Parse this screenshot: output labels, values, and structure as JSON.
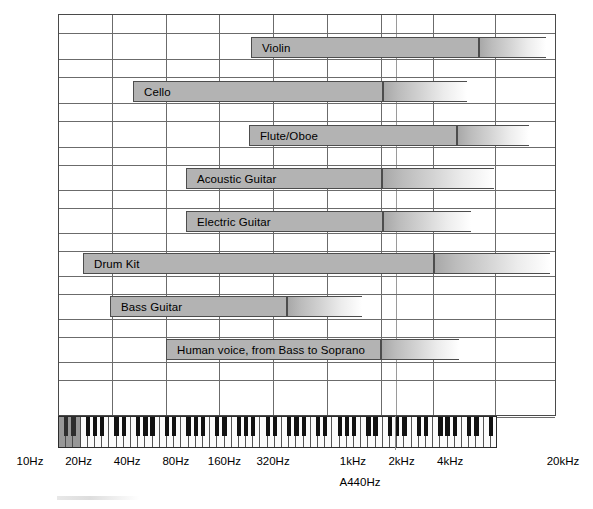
{
  "chart_data": {
    "type": "bar",
    "xlabel": "Frequency",
    "ylabel": "",
    "scale": "log",
    "grid": true,
    "legend": "none",
    "axis_note": "A440Hz",
    "xlim": [
      10,
      20000
    ],
    "tick_labels": [
      "10Hz",
      "20Hz",
      "40Hz",
      "80Hz",
      "160Hz",
      "320Hz",
      "1kHz",
      "2kHz",
      "4kHz",
      "20kHz"
    ],
    "tick_values": [
      10,
      20,
      40,
      80,
      160,
      320,
      1000,
      2000,
      4000,
      20000
    ],
    "categories": [
      "Violin",
      "Cello",
      "Flute/Oboe",
      "Acoustic Guitar",
      "Electric Guitar",
      "Drum Kit",
      "Bass Guitar",
      "Human voice, from Bass to Soprano"
    ],
    "series": [
      {
        "name": "fundamental range",
        "note": "solid bar = fundamental frequency range",
        "values": [
          {
            "label": "Violin",
            "low_hz": 196,
            "high_hz": 3520
          },
          {
            "label": "Cello",
            "low_hz": 65,
            "high_hz": 880
          },
          {
            "label": "Flute/Oboe",
            "low_hz": 196,
            "high_hz": 2349
          },
          {
            "label": "Acoustic Guitar",
            "low_hz": 82,
            "high_hz": 880
          },
          {
            "label": "Electric Guitar",
            "low_hz": 82,
            "high_hz": 1046
          },
          {
            "label": "Drum Kit",
            "low_hz": 25,
            "high_hz": 1760
          },
          {
            "label": "Bass Guitar",
            "low_hz": 41,
            "high_hz": 392
          },
          {
            "label": "Human voice, from Bass to Soprano",
            "low_hz": 82,
            "high_hz": 1046
          }
        ]
      },
      {
        "name": "harmonics fade",
        "note": "gradient extension = harmonic overtones trailing off",
        "values": [
          {
            "label": "Violin",
            "fade_to_hz": 15000
          },
          {
            "label": "Cello",
            "fade_to_hz": 6000
          },
          {
            "label": "Flute/Oboe",
            "fade_to_hz": 14000
          },
          {
            "label": "Acoustic Guitar",
            "fade_to_hz": 12000
          },
          {
            "label": "Electric Guitar",
            "fade_to_hz": 7000
          },
          {
            "label": "Drum Kit",
            "fade_to_hz": 16000
          },
          {
            "label": "Bass Guitar",
            "fade_to_hz": 3000
          },
          {
            "label": "Human voice, from Bass to Soprano",
            "fade_to_hz": 6000
          }
        ]
      }
    ],
    "bars": [
      {
        "label": "Violin",
        "x": 250,
        "solid_w": 228,
        "fade_w": 67,
        "y": 36
      },
      {
        "label": "Cello",
        "x": 132,
        "solid_w": 250,
        "fade_w": 84,
        "y": 80
      },
      {
        "label": "Flute/Oboe",
        "x": 248,
        "solid_w": 208,
        "fade_w": 72,
        "y": 124
      },
      {
        "label": "Acoustic Guitar",
        "x": 185,
        "solid_w": 196,
        "fade_w": 112,
        "y": 167
      },
      {
        "label": "Electric Guitar",
        "x": 185,
        "solid_w": 197,
        "fade_w": 88,
        "y": 210
      },
      {
        "label": "Drum Kit",
        "x": 82,
        "solid_w": 351,
        "fade_w": 116,
        "y": 252
      },
      {
        "label": "Bass Guitar",
        "x": 109,
        "solid_w": 177,
        "fade_w": 75,
        "y": 295
      },
      {
        "label": "Human voice, from Bass to Soprano",
        "x": 165,
        "solid_w": 215,
        "fade_w": 78,
        "y": 338
      }
    ],
    "gridlines": {
      "vertical_x": [
        111,
        165,
        218,
        272,
        326,
        380,
        395,
        432,
        494
      ],
      "vertical_thin_x": [
        395
      ],
      "horizontal_y": [
        14,
        32,
        58,
        76,
        102,
        120,
        146,
        164,
        189,
        207,
        232,
        250,
        275,
        293,
        318,
        336,
        361,
        379,
        416
      ]
    },
    "keyboard": {
      "white_key_count": 61,
      "shaded_left": true,
      "x": 58,
      "y": 416,
      "width": 439,
      "height": 32
    }
  }
}
